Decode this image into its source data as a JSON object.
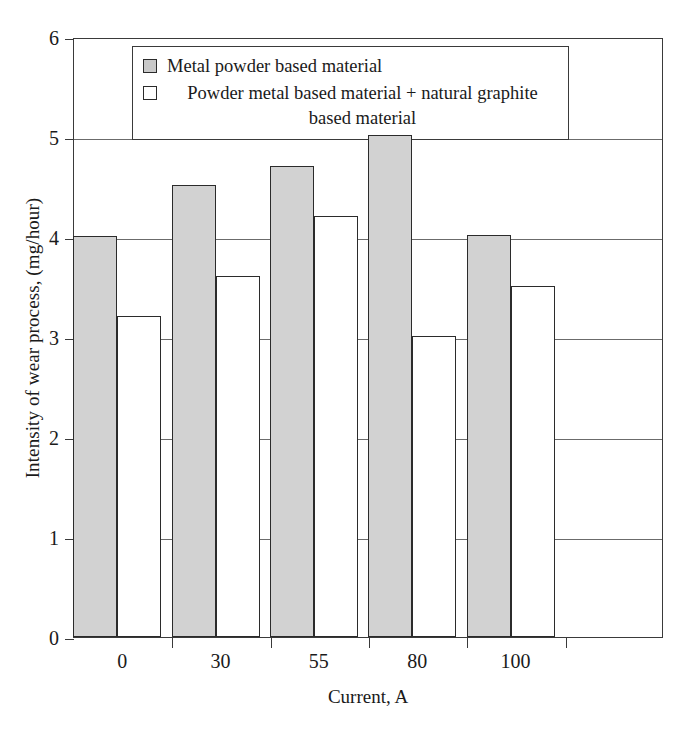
{
  "chart_data": {
    "type": "bar",
    "title": "",
    "xlabel": "Current, A",
    "ylabel": "Intensity of wear process, (mg/hour)",
    "categories": [
      "0",
      "30",
      "55",
      "80",
      "100",
      ""
    ],
    "series": [
      {
        "name": "Metal powder based material",
        "color": "#d2d2d2",
        "values": [
          4.01,
          4.52,
          4.71,
          5.02,
          4.02,
          null
        ]
      },
      {
        "name": "Powder metal based material + natural graphite based material",
        "color": "#ffffff",
        "values": [
          3.21,
          3.61,
          4.21,
          3.01,
          3.51,
          null
        ]
      }
    ],
    "ylim": [
      0,
      6
    ],
    "yticks": [
      0,
      1,
      2,
      3,
      4,
      5,
      6
    ],
    "ytick_labels": [
      "0",
      "1",
      "2",
      "3",
      "4",
      "5",
      "6"
    ],
    "grid": true,
    "grid_axis": "y",
    "legend_position": "upper-left-inside",
    "legend": [
      {
        "label": "Metal powder based material",
        "swatch": "gray",
        "lines": [
          "Metal powder based material"
        ]
      },
      {
        "label": "Powder metal based material + natural graphite based material",
        "swatch": "white",
        "lines": [
          "Powder metal based material + natural graphite",
          "based material"
        ]
      }
    ]
  }
}
